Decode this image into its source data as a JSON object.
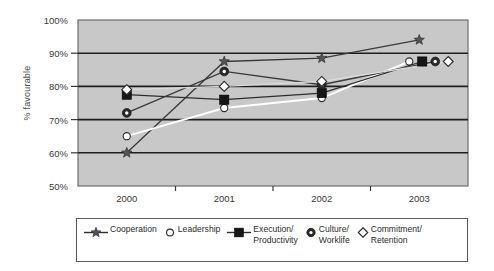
{
  "chart_data": {
    "type": "line",
    "title": "",
    "xlabel": "",
    "ylabel": "% favourable",
    "categories": [
      "2000",
      "2001",
      "2002",
      "2003"
    ],
    "ylim": [
      50,
      100
    ],
    "ytick_labels": [
      "50%",
      "60%",
      "70%",
      "80%",
      "90%",
      "100%"
    ],
    "ytick_values": [
      50,
      60,
      70,
      80,
      90,
      100
    ],
    "grid": true,
    "legend_position": "bottom",
    "plot_background": "#c8c8c8",
    "series": [
      {
        "name": "Cooperation",
        "marker": "star",
        "line_color": "#3a3a3a",
        "marker_color": "#555555",
        "values": [
          60.0,
          87.5,
          88.5,
          94.0
        ]
      },
      {
        "name": "Leadership",
        "marker": "circle-open",
        "line_color": "#ffffff",
        "marker_color": "#ffffff",
        "values": [
          65.0,
          73.5,
          76.5,
          87.5
        ]
      },
      {
        "name": "Execution/\nProductivity",
        "marker": "square",
        "line_color": "#2e2e2e",
        "marker_color": "#1c1c1c",
        "values": [
          77.5,
          76.0,
          78.0,
          87.5
        ]
      },
      {
        "name": "Culture/\nWorklife",
        "marker": "circle-donut",
        "line_color": "#3a3a3a",
        "marker_color": "#2a2a2a",
        "values": [
          72.0,
          84.5,
          80.5,
          87.5
        ]
      },
      {
        "name": "Commitment/\nRetention",
        "marker": "diamond-open",
        "line_color": "#dcdcdc",
        "marker_color": "#ffffff",
        "values": [
          79.0,
          80.0,
          81.5,
          87.5
        ]
      }
    ]
  },
  "legend": {
    "items": [
      {
        "label": "Cooperation",
        "marker": "star",
        "has_line": true
      },
      {
        "label": "Leadership",
        "marker": "circle-open",
        "has_line": false
      },
      {
        "label": "Execution/\nProductivity",
        "marker": "square",
        "has_line": true
      },
      {
        "label": "Culture/\nWorklife",
        "marker": "circle-donut",
        "has_line": false
      },
      {
        "label": "Commitment/\nRetention",
        "marker": "diamond-open",
        "has_line": false
      }
    ]
  }
}
